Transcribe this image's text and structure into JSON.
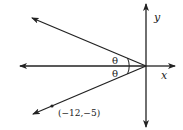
{
  "diagram": {
    "type": "coordinate-plane-angle",
    "axes": {
      "x_label": "x",
      "y_label": "y"
    },
    "angle_labels": [
      "θ",
      "θ"
    ],
    "point": {
      "label": "(−12,−5)",
      "x": -12,
      "y": -5
    },
    "colors": {
      "line": "#222222",
      "background": "#ffffff"
    }
  }
}
